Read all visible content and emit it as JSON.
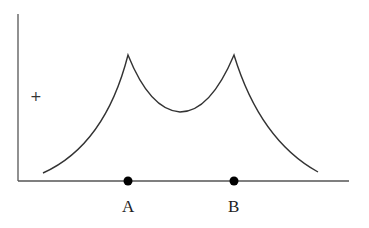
{
  "diagram": {
    "points": [
      {
        "label": "A",
        "x": 128
      },
      {
        "label": "B",
        "x": 234
      }
    ],
    "marker": "+",
    "colors": {
      "line": "#333333",
      "dot": "#000000",
      "background": "#ffffff"
    }
  }
}
